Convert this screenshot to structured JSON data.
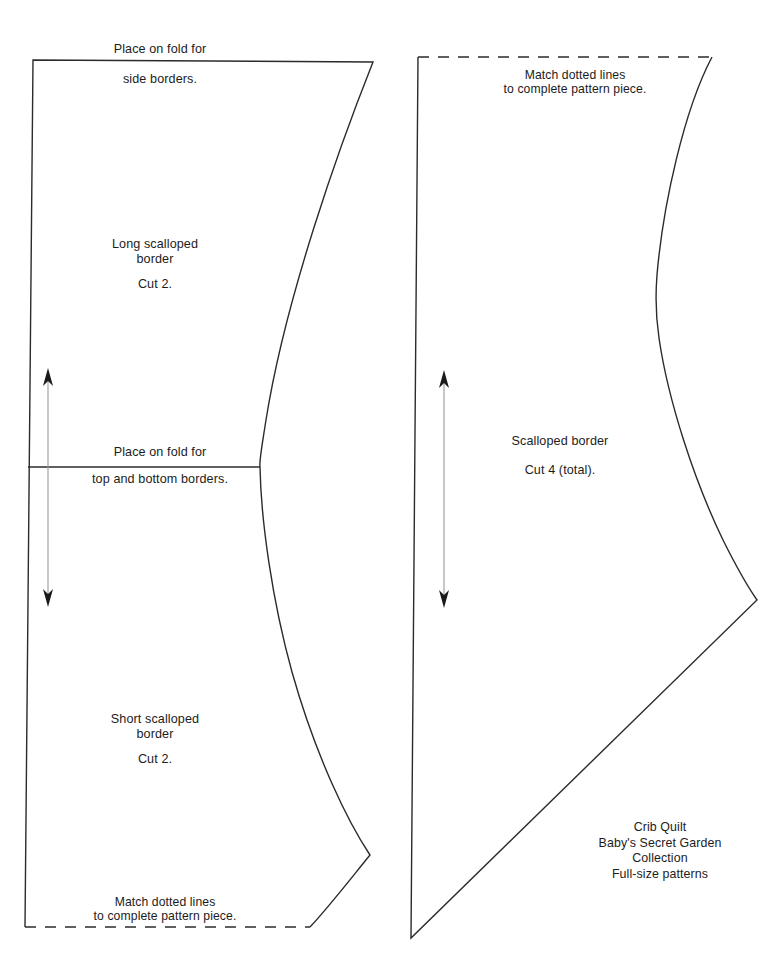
{
  "sheet": {
    "caption": "Crib Quilt\nBaby's Secret Garden\nCollection\nFull-size patterns",
    "ink_color": "#2b2b2b",
    "background_color": "#ffffff"
  },
  "left_piece": {
    "fold_note_line1": "Place on fold for",
    "fold_note_line2": "side borders.",
    "upper_section": {
      "name": "Long scalloped\nborder",
      "cut": "Cut 2."
    },
    "fold_note_mid_line1": "Place on fold for",
    "fold_note_mid_line2": "top and bottom borders.",
    "lower_section": {
      "name": "Short scalloped\nborder",
      "cut": "Cut 2."
    },
    "match_note": "Match dotted lines\nto complete pattern piece."
  },
  "right_piece": {
    "match_note": "Match dotted lines\nto complete pattern piece.",
    "name": "Scalloped border",
    "cut": "Cut 4 (total)."
  }
}
